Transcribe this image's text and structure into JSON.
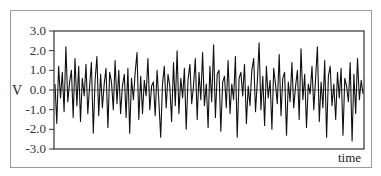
{
  "chart_data": {
    "type": "line",
    "title": "",
    "xlabel": "time",
    "ylabel": "V",
    "ylim": [
      -3.0,
      3.0
    ],
    "yticks": [
      "3.0",
      "2.0",
      "1.0",
      "0.0",
      "-1.0",
      "-2.0",
      "-3.0"
    ],
    "grid": false,
    "zero_line": true,
    "legend": null,
    "series": [
      {
        "name": "noise signal",
        "description": "random noise voltage vs time, approx. zero-mean, amplitude mostly within ±2.5",
        "values": [
          0.3,
          -1.7,
          1.2,
          -0.4,
          0.9,
          -1.1,
          2.2,
          -0.6,
          0.4,
          1.0,
          -1.4,
          1.6,
          -0.8,
          1.2,
          -1.6,
          0.6,
          -0.3,
          1.3,
          -1.2,
          0.2,
          1.4,
          -2.2,
          0.5,
          1.7,
          -1.3,
          0.8,
          -0.9,
          0.3,
          1.1,
          -1.9,
          0.9,
          0.4,
          -1.0,
          1.5,
          -0.7,
          1.0,
          -1.2,
          0.2,
          0.8,
          -1.4,
          1.1,
          -2.2,
          0.6,
          -0.5,
          0.9,
          1.9,
          -1.5,
          0.7,
          -1.2,
          0.5,
          -0.3,
          1.6,
          -1.0,
          0.2,
          0.4,
          -1.3,
          1.0,
          -0.6,
          -2.4,
          0.3,
          1.2,
          -0.9,
          0.8,
          0.2,
          -1.6,
          1.4,
          -0.8,
          2.0,
          -1.2,
          0.6,
          -0.4,
          1.1,
          -2.0,
          0.5,
          1.3,
          -0.7,
          0.2,
          1.6,
          -1.5,
          0.9,
          -0.5,
          1.9,
          -0.8,
          0.3,
          -1.9,
          1.2,
          -0.6,
          2.3,
          -1.4,
          0.8,
          1.0,
          -2.1,
          0.4,
          0.7,
          -0.9,
          1.5,
          -1.2,
          0.3,
          -0.5,
          1.7,
          -2.4,
          0.6,
          0.9,
          -0.3,
          1.3,
          -1.7,
          0.2,
          -0.8,
          1.0,
          1.6,
          -1.1,
          0.4,
          2.4,
          -1.0,
          0.7,
          -1.8,
          1.2,
          -0.4,
          0.5,
          -2.0,
          1.1,
          0.3,
          -0.7,
          1.8,
          -1.3,
          0.6,
          0.9,
          -2.3,
          0.4,
          -0.6,
          1.4,
          -0.9,
          0.2,
          1.0,
          -1.5,
          2.1,
          -0.5,
          0.8,
          -1.9,
          0.3,
          -0.2,
          1.2,
          -1.0,
          0.6,
          2.2,
          -1.6,
          0.4,
          -0.9,
          1.5,
          -2.4,
          0.7,
          1.2,
          -0.8,
          0.3,
          -1.5,
          0.9,
          -0.4,
          1.1,
          -2.3,
          0.6,
          0.2,
          -0.6,
          1.4,
          -2.6,
          0.8,
          -1.2,
          1.6,
          -0.5,
          0.5,
          -0.2
        ]
      }
    ]
  },
  "axes": {
    "x_label": "time",
    "y_label": "V",
    "y_ticks": [
      "3.0",
      "2.0",
      "1.0",
      "0.0",
      "-1.0",
      "-2.0",
      "-3.0"
    ]
  },
  "colors": {
    "line": "#111111",
    "axis": "#333333",
    "frame": "#9a9a9a"
  }
}
